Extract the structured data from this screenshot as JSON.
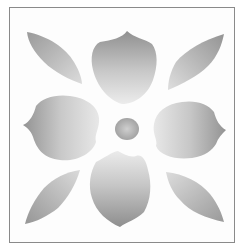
{
  "image": {
    "subject": "stencil floral tile",
    "description": "Grayscale stenciled four-petal flower with a round center and four diagonal leaves inside a thin square frame",
    "colors": {
      "background": "#fdfdfd",
      "frame": "#8a8a8a",
      "petal_dark": "#8f8f8f",
      "petal_light": "#e6e6e6"
    },
    "elements": [
      {
        "name": "center-dot",
        "shape": "circle"
      },
      {
        "name": "petal-top",
        "shape": "petal"
      },
      {
        "name": "petal-bottom",
        "shape": "petal"
      },
      {
        "name": "petal-left",
        "shape": "petal"
      },
      {
        "name": "petal-right",
        "shape": "petal"
      },
      {
        "name": "leaf-top-left",
        "shape": "leaf"
      },
      {
        "name": "leaf-top-right",
        "shape": "leaf"
      },
      {
        "name": "leaf-bottom-left",
        "shape": "leaf"
      },
      {
        "name": "leaf-bottom-right",
        "shape": "leaf"
      }
    ]
  }
}
